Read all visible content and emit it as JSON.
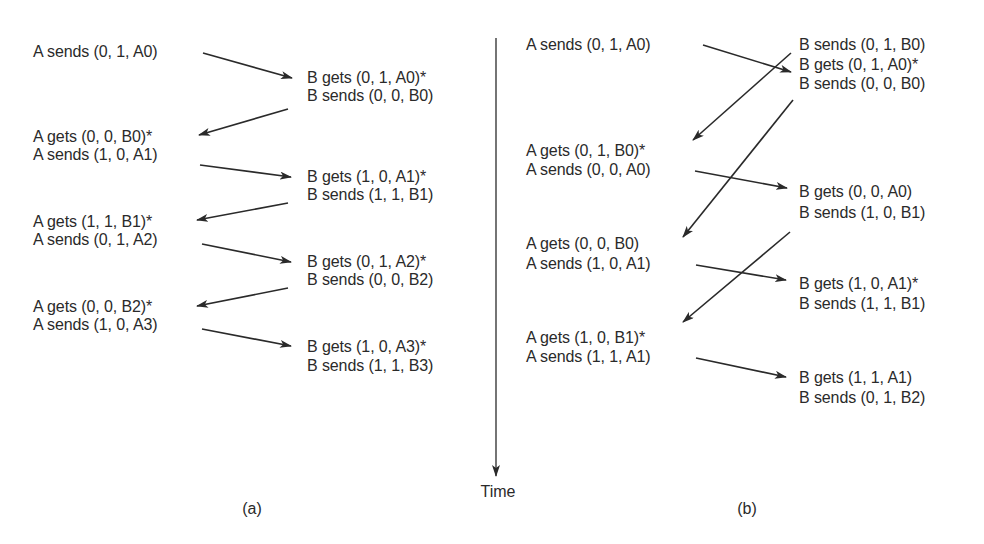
{
  "diagram": {
    "time_axis": {
      "label": "Time",
      "x": 496,
      "y_start": 38,
      "y_end": 476
    },
    "colors": {
      "text": "#2a2a2a",
      "line": "#2a2a2a",
      "background": "#ffffff"
    },
    "panels": [
      {
        "caption": "(a)",
        "caption_pos": {
          "x": 252,
          "y": 500
        },
        "labels": [
          {
            "text": "A sends (0, 1, A0)",
            "x": 33,
            "y": 43
          },
          {
            "text": "B gets (0, 1, A0)*",
            "x": 307,
            "y": 69
          },
          {
            "text": "B sends (0, 0, B0)",
            "x": 307,
            "y": 87
          },
          {
            "text": "A gets (0, 0, B0)*",
            "x": 33,
            "y": 128
          },
          {
            "text": "A sends (1, 0, A1)",
            "x": 33,
            "y": 146
          },
          {
            "text": "B gets (1, 0, A1)*",
            "x": 307,
            "y": 168
          },
          {
            "text": "B sends (1, 1, B1)",
            "x": 307,
            "y": 186
          },
          {
            "text": "A gets (1, 1, B1)*",
            "x": 33,
            "y": 213
          },
          {
            "text": "A sends (0, 1, A2)",
            "x": 33,
            "y": 231
          },
          {
            "text": "B gets (0, 1, A2)*",
            "x": 307,
            "y": 253
          },
          {
            "text": "B sends (0, 0, B2)",
            "x": 307,
            "y": 271
          },
          {
            "text": "A gets (0, 0, B2)*",
            "x": 33,
            "y": 298
          },
          {
            "text": "A sends (1, 0, A3)",
            "x": 33,
            "y": 316
          },
          {
            "text": "B gets (1, 0, A3)*",
            "x": 307,
            "y": 338
          },
          {
            "text": "B sends (1, 1, B3)",
            "x": 307,
            "y": 357
          }
        ],
        "arrows": [
          {
            "from": [
              203,
              53
            ],
            "to": [
              292,
              78
            ],
            "msg": "(0, 1, A0)"
          },
          {
            "from": [
              288,
              109
            ],
            "to": [
              199,
              135
            ],
            "msg": "(0, 0, B0)"
          },
          {
            "from": [
              200,
              165
            ],
            "to": [
              291,
              177
            ],
            "msg": "(1, 0, A1)"
          },
          {
            "from": [
              288,
              203
            ],
            "to": [
              197,
              220
            ],
            "msg": "(1, 1, B1)"
          },
          {
            "from": [
              202,
              244
            ],
            "to": [
              291,
              262
            ],
            "msg": "(0, 1, A2)"
          },
          {
            "from": [
              288,
              288
            ],
            "to": [
              197,
              306
            ],
            "msg": "(0, 0, B2)"
          },
          {
            "from": [
              202,
              329
            ],
            "to": [
              291,
              346
            ],
            "msg": "(1, 0, A3)"
          }
        ]
      },
      {
        "caption": "(b)",
        "caption_pos": {
          "x": 747,
          "y": 500
        },
        "labels": [
          {
            "text": "A sends (0, 1, A0)",
            "x": 526,
            "y": 36
          },
          {
            "text": "B sends (0, 1, B0)",
            "x": 799,
            "y": 36
          },
          {
            "text": "B gets (0, 1, A0)*",
            "x": 799,
            "y": 56
          },
          {
            "text": "B sends (0, 0, B0)",
            "x": 799,
            "y": 75
          },
          {
            "text": "A gets (0, 1, B0)*",
            "x": 526,
            "y": 142
          },
          {
            "text": "A sends (0, 0, A0)",
            "x": 526,
            "y": 161
          },
          {
            "text": "B gets (0, 0, A0)",
            "x": 799,
            "y": 183
          },
          {
            "text": "B sends (1, 0, B1)",
            "x": 799,
            "y": 204
          },
          {
            "text": "A gets (0, 0, B0)",
            "x": 526,
            "y": 235
          },
          {
            "text": "A sends (1, 0, A1)",
            "x": 526,
            "y": 255
          },
          {
            "text": "B gets (1, 0, A1)*",
            "x": 799,
            "y": 275
          },
          {
            "text": "B sends (1, 1, B1)",
            "x": 799,
            "y": 295
          },
          {
            "text": "A gets (1, 0, B1)*",
            "x": 526,
            "y": 329
          },
          {
            "text": "A sends (1, 1, A1)",
            "x": 526,
            "y": 348
          },
          {
            "text": "B gets (1, 1, A1)",
            "x": 799,
            "y": 369
          },
          {
            "text": "B sends (0, 1, B2)",
            "x": 799,
            "y": 389
          }
        ],
        "arrows": [
          {
            "from": [
              703,
              45
            ],
            "to": [
              791,
              72
            ],
            "msg": "(0, 1, A0)"
          },
          {
            "from": [
              791,
              53
            ],
            "to": [
              693,
              140
            ],
            "msg": "(0, 1, B0)"
          },
          {
            "from": [
              793,
              100
            ],
            "to": [
              683,
              237
            ],
            "msg": "(0, 0, B0)"
          },
          {
            "from": [
              695,
              171
            ],
            "to": [
              787,
              188
            ],
            "msg": "(0, 0, A0)"
          },
          {
            "from": [
              790,
              232
            ],
            "to": [
              683,
              322
            ],
            "msg": "(1, 0, B1)"
          },
          {
            "from": [
              696,
              265
            ],
            "to": [
              786,
              280
            ],
            "msg": "(1, 0, A1)"
          },
          {
            "from": [
              696,
              358
            ],
            "to": [
              786,
              377
            ],
            "msg": "(1, 1, A1)"
          }
        ]
      }
    ]
  }
}
